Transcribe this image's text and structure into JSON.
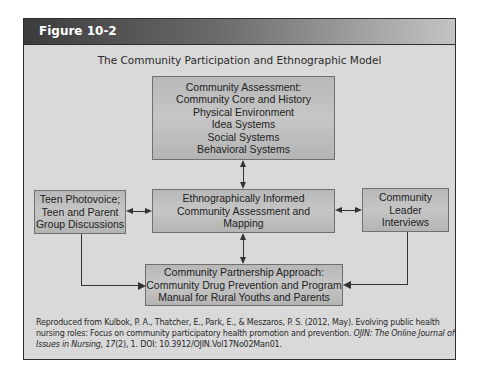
{
  "figure": {
    "label": "Figure 10-2",
    "title": "The Community Participation and Ethnographic Model"
  },
  "diagram": {
    "nodes": {
      "community_assessment": {
        "lines": [
          "Community Assessment:",
          "Community Core and History",
          "Physical Environment",
          "Idea Systems",
          "Social Systems",
          "Behavioral Systems"
        ]
      },
      "teen_photovoice": {
        "lines": [
          "Teen Photovoice;",
          "Teen and Parent",
          "Group Discussions"
        ]
      },
      "ethnographic_mapping": {
        "lines": [
          "Ethnographically Informed",
          "Community Assessment and",
          "Mapping"
        ]
      },
      "leader_interviews": {
        "lines": [
          "Community",
          "Leader",
          "Interviews"
        ]
      },
      "partnership_approach": {
        "lines": [
          "Community Partnership Approach:",
          "Community Drug Prevention and Program",
          "Manual for Rural Youths and Parents"
        ]
      }
    },
    "edges": [
      {
        "from": "community_assessment",
        "to": "ethnographic_mapping",
        "type": "bidirectional"
      },
      {
        "from": "teen_photovoice",
        "to": "ethnographic_mapping",
        "type": "bidirectional"
      },
      {
        "from": "ethnographic_mapping",
        "to": "leader_interviews",
        "type": "bidirectional"
      },
      {
        "from": "ethnographic_mapping",
        "to": "partnership_approach",
        "type": "bidirectional"
      },
      {
        "from": "teen_photovoice",
        "to": "partnership_approach",
        "type": "directed"
      },
      {
        "from": "leader_interviews",
        "to": "partnership_approach",
        "type": "directed"
      }
    ]
  },
  "credit": {
    "text_1": "Reproduced from Kulbok, P. A., Thatcher, E., Park, E., & Meszaros, P. S. (2012, May). Evolving public health nursing roles: Focus on community participatory health promotion and prevention. ",
    "journal": "OJIN: The Online Journal of Issues in Nursing, 17",
    "text_2": "(2), 1. DOI: 10.3912/OJIN.Vol17No02Man01."
  },
  "colors": {
    "frame_bg": "#d9d9d9",
    "box_bg": "#bdbdbd",
    "header_dark": "#3c3c3c",
    "header_light": "#c4c4c4"
  }
}
